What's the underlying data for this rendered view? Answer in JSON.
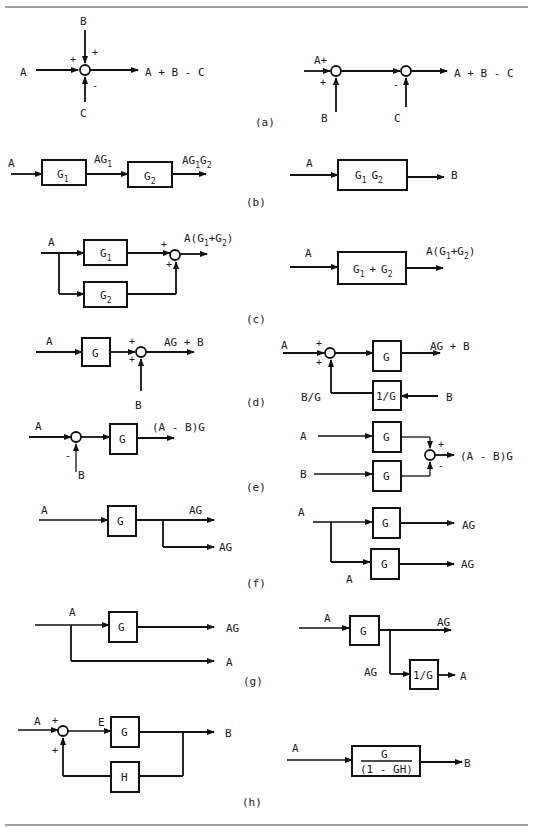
{
  "figure": {
    "panels": [
      {
        "id": "a",
        "caption": "(a)",
        "left": {
          "inputs": [
            "A",
            "B",
            "C"
          ],
          "signs": [
            "+",
            "+",
            "-"
          ],
          "output": "A + B - C"
        },
        "right": {
          "inputs": [
            "A+",
            "B",
            "C"
          ],
          "signs": [
            "+",
            "-"
          ],
          "output": "A + B - C"
        }
      },
      {
        "id": "b",
        "caption": "(b)",
        "left": {
          "input": "A",
          "blocks": [
            "G1",
            "G2"
          ],
          "intermediate": "AG1",
          "output": "AG1G2"
        },
        "right": {
          "input": "A",
          "block": "G1 G2",
          "output": "B"
        }
      },
      {
        "id": "c",
        "caption": "(c)",
        "left": {
          "input": "A",
          "blocks": [
            "G1",
            "G2"
          ],
          "signs": [
            "+",
            "+"
          ],
          "output": "A(G1+G2)"
        },
        "right": {
          "input": "A",
          "block": "G1 + G2",
          "output": "A(G1+G2)"
        }
      },
      {
        "id": "d",
        "caption": "(d)",
        "left": {
          "input": "A",
          "block": "G",
          "signs": [
            "+",
            "+"
          ],
          "summed": "B",
          "output": "AG + B"
        },
        "right": {
          "input": "A",
          "signs": [
            "+",
            "+"
          ],
          "block": "G",
          "feed_block": "1/G",
          "feed_in": "B",
          "feed_label": "B/G",
          "output": "AG + B"
        }
      },
      {
        "id": "e",
        "caption": "(e)",
        "left": {
          "input": "A",
          "sign": "-",
          "subtracted": "B",
          "block": "G",
          "output": "(A - B)G"
        },
        "right": {
          "inputs": [
            "A",
            "B"
          ],
          "blocks": [
            "G",
            "G"
          ],
          "signs": [
            "+",
            "-"
          ],
          "output": "(A - B)G"
        }
      },
      {
        "id": "f",
        "caption": "(f)",
        "left": {
          "input": "A",
          "block": "G",
          "outputs": [
            "AG",
            "AG"
          ]
        },
        "right": {
          "input": "A",
          "branch_label": "A",
          "blocks": [
            "G",
            "G"
          ],
          "outputs": [
            "AG",
            "AG"
          ]
        }
      },
      {
        "id": "g",
        "caption": "(g)",
        "left": {
          "input": "A",
          "block": "G",
          "outputs": [
            "AG",
            "A"
          ]
        },
        "right": {
          "input": "A",
          "block": "G",
          "output": "AG",
          "branch_label": "AG",
          "inv_block": "1/G",
          "inv_output": "A"
        }
      },
      {
        "id": "h",
        "caption": "(h)",
        "left": {
          "input": "A",
          "signs": [
            "+",
            "+"
          ],
          "error": "E",
          "forward_block": "G",
          "feedback_block": "H",
          "output": "B"
        },
        "right": {
          "input": "A",
          "numerator": "G",
          "denominator": "(1 - GH)",
          "output": "B"
        }
      }
    ]
  },
  "glyphs": {
    "G": "G",
    "sub1": "1",
    "sub2": "2",
    "AG_prefix": "AG",
    "A_paren": "A(",
    "plus": "+",
    "close_paren": ")",
    "G1G2_space": "  "
  }
}
